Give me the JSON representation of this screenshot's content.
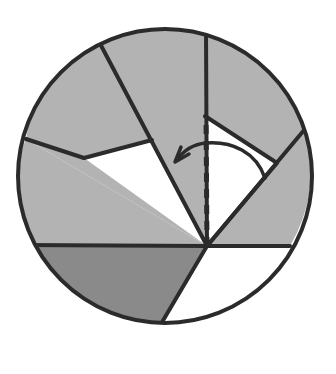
{
  "figure": {
    "type": "geometric-diagram",
    "canvas": {
      "width": 336,
      "height": 374,
      "background": "#ffffff"
    },
    "colors": {
      "outline": "#2b2b2b",
      "light_gray_fill": "#b3b3b3",
      "dark_gray_fill": "#8a8a8a",
      "white_fill": "#ffffff",
      "dashed_line": "#2b2b2b",
      "arrow": "#2b2b2b"
    },
    "circle": {
      "label": "disc-outline",
      "center_x": 165,
      "center_y": 176,
      "radius": 147,
      "stroke_width": 4
    },
    "vertex": {
      "label": "sector-apex",
      "x": 207,
      "y": 246
    },
    "spokes": [
      {
        "name": "spoke-up-vertical",
        "end_x": 206,
        "end_y": 29,
        "note": "vertical radius upward from apex"
      },
      {
        "name": "spoke-upper-left",
        "end_x": 96,
        "end_y": 36
      },
      {
        "name": "spoke-left-upper",
        "end_x": 26,
        "end_y": 139
      },
      {
        "name": "spoke-left-horizontal",
        "end_x": 20,
        "end_y": 245
      },
      {
        "name": "spoke-lower-left",
        "end_x": 158,
        "end_y": 329
      },
      {
        "name": "spoke-lower-right",
        "end_x": 288,
        "end_y": 300
      },
      {
        "name": "spoke-right-horizontal",
        "end_x": 290,
        "end_y": 246
      },
      {
        "name": "spoke-upper-right",
        "end_x": 305,
        "end_y": 129
      }
    ],
    "regions": [
      {
        "name": "region-upper-left-large",
        "fill": "light_gray_fill"
      },
      {
        "name": "region-left-middle",
        "fill": "light_gray_fill"
      },
      {
        "name": "region-white-wedge-left",
        "fill": "white_fill"
      },
      {
        "name": "region-upper-right-top",
        "fill": "light_gray_fill"
      },
      {
        "name": "region-white-wedge-right",
        "fill": "white_fill"
      },
      {
        "name": "region-right-lower",
        "fill": "light_gray_fill"
      },
      {
        "name": "region-bottom-white",
        "fill": "white_fill"
      },
      {
        "name": "region-bottom-dark",
        "fill": "dark_gray_fill"
      }
    ],
    "dashed_segment": {
      "name": "dashed-vertical-reference",
      "from_x": 207,
      "from_y": 246,
      "to_x": 206,
      "to_y": 116,
      "dash_pattern": "9 7",
      "stroke_width": 5
    },
    "rotation_arrow": {
      "name": "rotation-arc-arrow",
      "direction": "counterclockwise",
      "start_x": 265,
      "start_y": 178,
      "end_x": 176,
      "end_y": 161,
      "apex_y": 144,
      "stroke_width": 3.5,
      "arrowhead_at": "end"
    }
  }
}
